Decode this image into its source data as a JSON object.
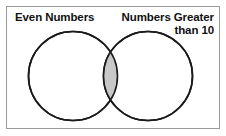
{
  "figure": {
    "type": "venn-diagram",
    "width": 226,
    "height": 136,
    "background_color": "#ffffff",
    "border_color": "#9a9a9a"
  },
  "labels": {
    "left_set": "Even Numbers",
    "right_set": "Numbers Greater\nthan 10"
  },
  "sets": {
    "left": {
      "name": "Even Numbers",
      "center_x": 73,
      "center_y": 76,
      "radius": 44.5,
      "fill": "#ffffff",
      "stroke": "#1a1a1a"
    },
    "right": {
      "name": "Numbers Greater than 10",
      "center_x": 148,
      "center_y": 76,
      "radius": 44.5,
      "fill": "#ffffff",
      "stroke": "#1a1a1a"
    }
  },
  "intersection": {
    "label": "shaded-overlap",
    "fill": "#c8c8c8",
    "stroke": "#1a1a1a"
  }
}
